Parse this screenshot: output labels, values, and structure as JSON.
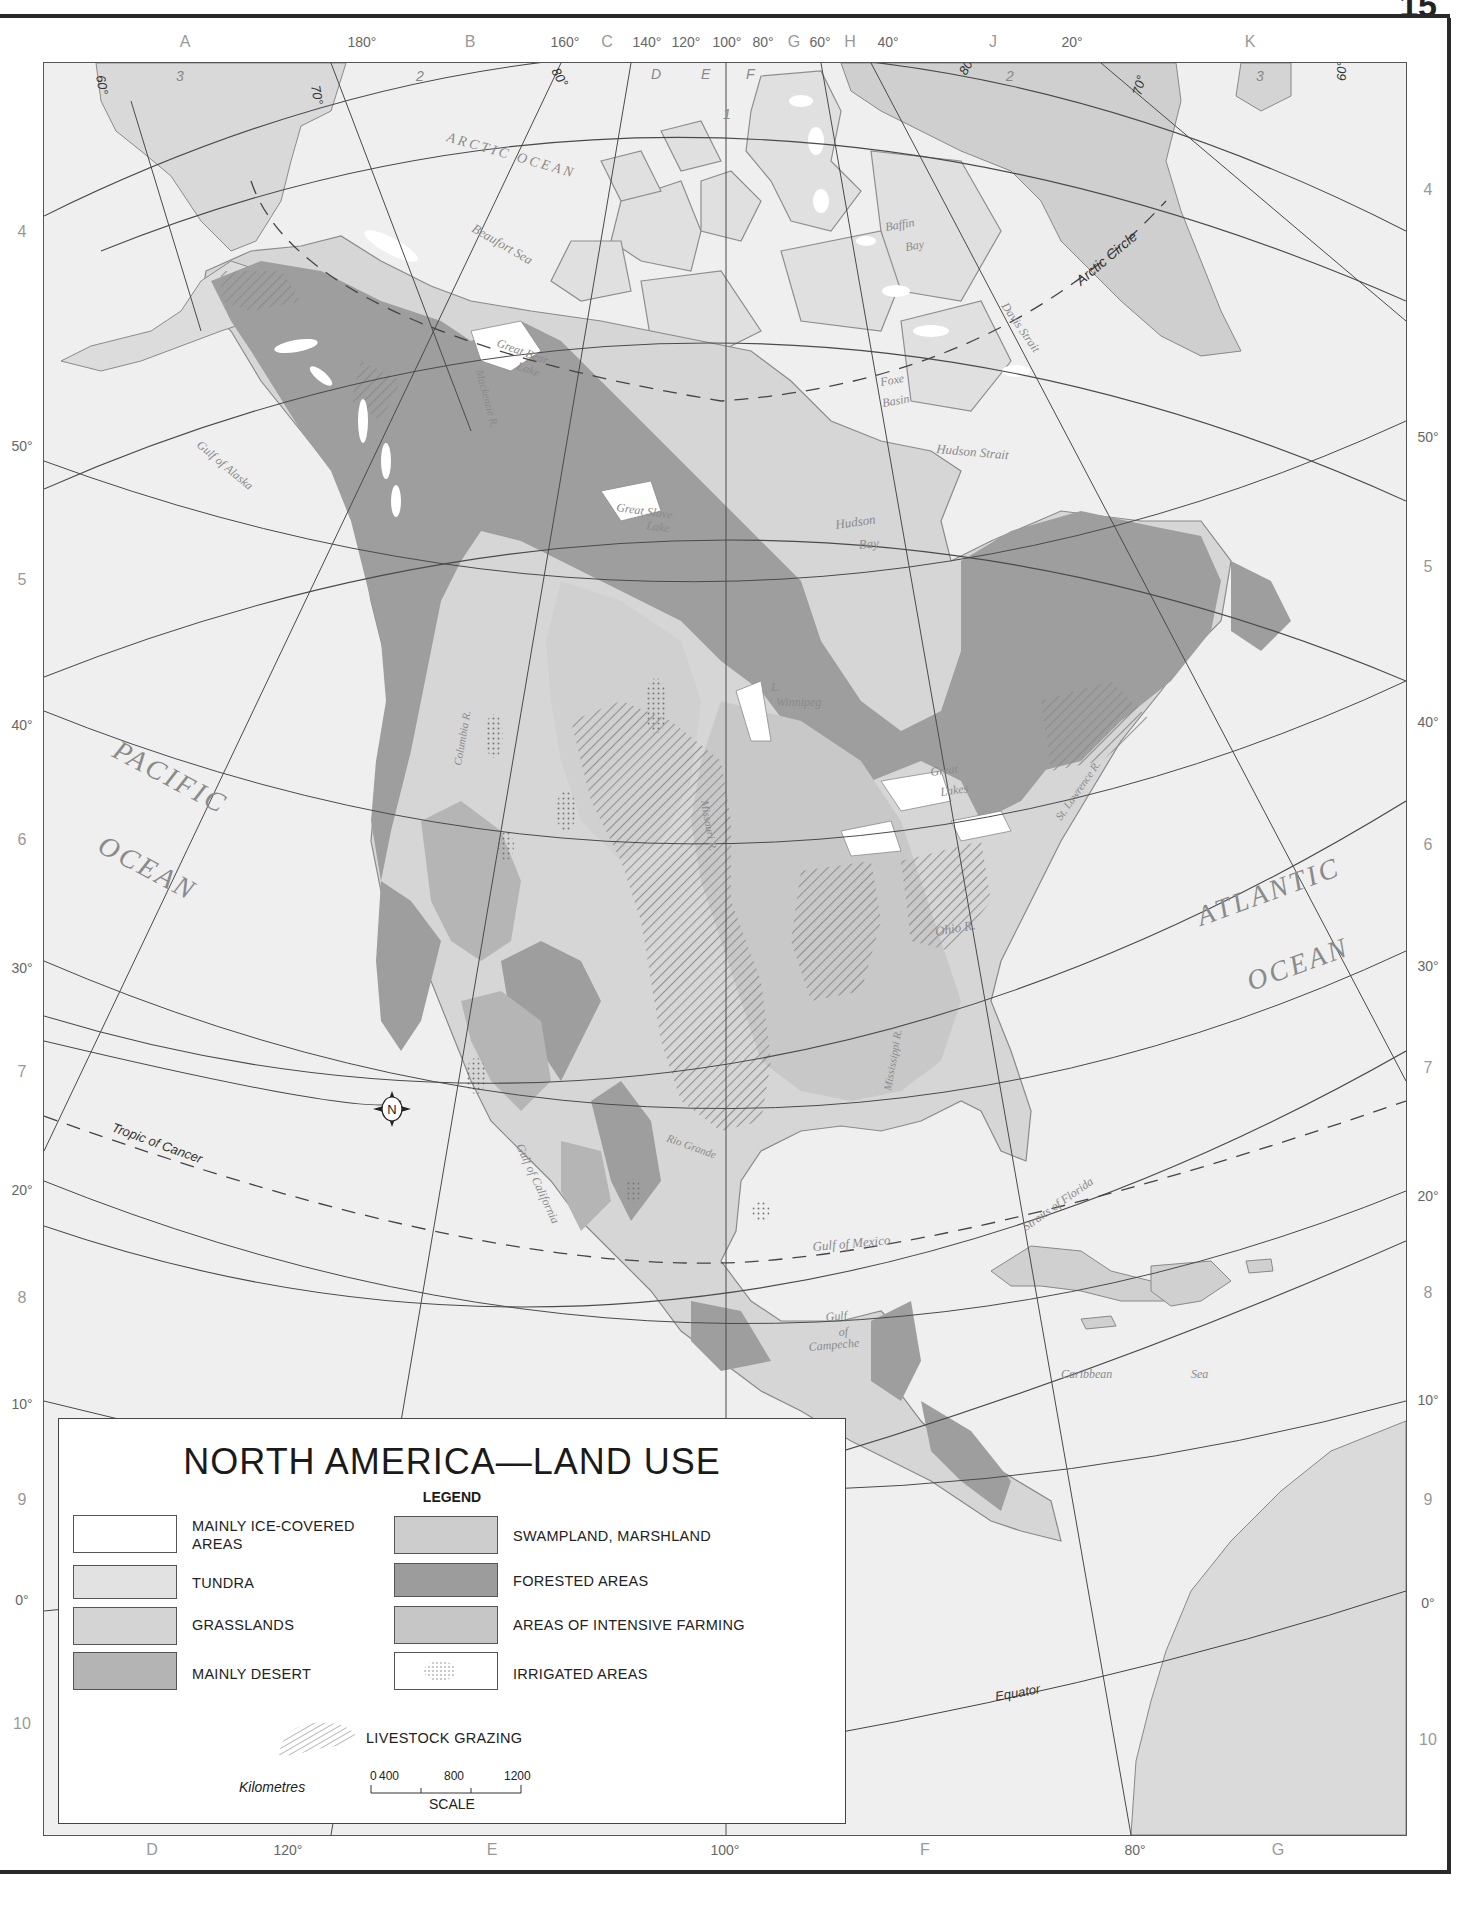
{
  "page": {
    "number": "15"
  },
  "map": {
    "title": "NORTH AMERICA-LAND USE",
    "top_labels": [
      {
        "text": "A",
        "x": 185,
        "type": "grid"
      },
      {
        "text": "180°",
        "x": 362,
        "type": "deg"
      },
      {
        "text": "B",
        "x": 470,
        "type": "grid"
      },
      {
        "text": "160°",
        "x": 565,
        "type": "deg"
      },
      {
        "text": "C",
        "x": 607,
        "type": "grid"
      },
      {
        "text": "140°",
        "x": 647,
        "type": "deg"
      },
      {
        "text": "120°",
        "x": 686,
        "type": "deg"
      },
      {
        "text": "100°",
        "x": 727,
        "type": "deg"
      },
      {
        "text": "80°",
        "x": 763,
        "type": "deg"
      },
      {
        "text": "G",
        "x": 794,
        "type": "grid"
      },
      {
        "text": "60°",
        "x": 820,
        "type": "deg"
      },
      {
        "text": "H",
        "x": 850,
        "type": "grid"
      },
      {
        "text": "40°",
        "x": 888,
        "type": "deg"
      },
      {
        "text": "J",
        "x": 993,
        "type": "grid"
      },
      {
        "text": "20°",
        "x": 1072,
        "type": "deg"
      },
      {
        "text": "K",
        "x": 1250,
        "type": "grid"
      }
    ],
    "bottom_labels": [
      {
        "text": "D",
        "x": 152,
        "type": "grid"
      },
      {
        "text": "120°",
        "x": 288,
        "type": "deg"
      },
      {
        "text": "E",
        "x": 492,
        "type": "grid"
      },
      {
        "text": "100°",
        "x": 725,
        "type": "deg"
      },
      {
        "text": "F",
        "x": 925,
        "type": "grid"
      },
      {
        "text": "80°",
        "x": 1135,
        "type": "deg"
      },
      {
        "text": "G",
        "x": 1278,
        "type": "grid"
      }
    ],
    "left_labels": [
      {
        "text": "4",
        "y": 232,
        "type": "grid"
      },
      {
        "text": "50°",
        "y": 446,
        "type": "deg"
      },
      {
        "text": "5",
        "y": 580,
        "type": "grid"
      },
      {
        "text": "40°",
        "y": 725,
        "type": "deg"
      },
      {
        "text": "6",
        "y": 840,
        "type": "grid"
      },
      {
        "text": "30°",
        "y": 968,
        "type": "deg"
      },
      {
        "text": "7",
        "y": 1072,
        "type": "grid"
      },
      {
        "text": "20°",
        "y": 1190,
        "type": "deg"
      },
      {
        "text": "8",
        "y": 1298,
        "type": "grid"
      },
      {
        "text": "10°",
        "y": 1404,
        "type": "deg"
      },
      {
        "text": "9",
        "y": 1500,
        "type": "grid"
      },
      {
        "text": "0°",
        "y": 1600,
        "type": "deg"
      },
      {
        "text": "10",
        "y": 1724,
        "type": "grid"
      }
    ],
    "right_labels": [
      {
        "text": "4",
        "y": 190,
        "type": "grid"
      },
      {
        "text": "50°",
        "y": 437,
        "type": "deg"
      },
      {
        "text": "5",
        "y": 567,
        "type": "grid"
      },
      {
        "text": "40°",
        "y": 722,
        "type": "deg"
      },
      {
        "text": "6",
        "y": 845,
        "type": "grid"
      },
      {
        "text": "30°",
        "y": 966,
        "type": "deg"
      },
      {
        "text": "7",
        "y": 1068,
        "type": "grid"
      },
      {
        "text": "20°",
        "y": 1196,
        "type": "deg"
      },
      {
        "text": "8",
        "y": 1293,
        "type": "grid"
      },
      {
        "text": "10°",
        "y": 1400,
        "type": "deg"
      },
      {
        "text": "9",
        "y": 1500,
        "type": "grid"
      },
      {
        "text": "0°",
        "y": 1603,
        "type": "deg"
      },
      {
        "text": "10",
        "y": 1740,
        "type": "grid"
      }
    ],
    "inner_labels": {
      "top_row": [
        "3",
        "2",
        "D",
        "E",
        "F",
        "1",
        "2",
        "3"
      ],
      "corner_degrees": [
        "60°",
        "70°",
        "80°",
        "80°",
        "70°",
        "60°"
      ]
    },
    "place_labels": {
      "arctic_ocean": "ARCTIC OCEAN",
      "beaufort_sea": "Beaufort Sea",
      "baffin_bay_1": "Baffin",
      "baffin_bay_2": "Bay",
      "davis_strait": "Davis Strait",
      "arctic_circle": "Arctic Circle",
      "foxe_basin_1": "Foxe",
      "foxe_basin_2": "Basin",
      "hudson_strait": "Hudson Strait",
      "hudson_bay_1": "Hudson",
      "hudson_bay_2": "Bay",
      "great_bear_lake_1": "Great Bear",
      "great_bear_lake_2": "Lake",
      "mackenzie_r": "Mackenzie R.",
      "great_slave_lake_1": "Great Slave",
      "great_slave_lake_2": "Lake",
      "gulf_of_alaska": "Gulf of Alaska",
      "pacific_1": "PACIFIC",
      "pacific_2": "OCEAN",
      "l_winnipeg_1": "L.",
      "l_winnipeg_2": "Winnipeg",
      "great_lakes_1": "Great",
      "great_lakes_2": "Lakes",
      "st_lawrence": "St. Lawrence R.",
      "atlantic_1": "ATLANTIC",
      "atlantic_2": "OCEAN",
      "columbia_r": "Columbia R.",
      "missouri_r": "Missouri R.",
      "ohio_r": "Ohio R.",
      "mississippi_r": "Mississippi R.",
      "rio_grande": "Rio Grande",
      "tropic_of_cancer": "Tropic of Cancer",
      "gulf_of_california": "Gulf of California",
      "gulf_of_mexico": "Gulf of Mexico",
      "straits_of_florida": "Straits of Florida",
      "gulf_of_campeche_1": "Gulf",
      "gulf_of_campeche_2": "of",
      "gulf_of_campeche_3": "Campeche",
      "caribbean_1": "Caribbean",
      "caribbean_2": "Sea",
      "equator": "Equator",
      "compass": "N"
    }
  },
  "legend": {
    "title": "NORTH AMERICA—LAND USE",
    "subtitle": "LEGEND",
    "items": [
      {
        "label_1": "MAINLY ICE-COVERED",
        "label_2": "AREAS",
        "color": "#ffffff",
        "pattern": "none"
      },
      {
        "label_1": "TUNDRA",
        "label_2": "",
        "color": "#e2e2e2",
        "pattern": "none"
      },
      {
        "label_1": "GRASSLANDS",
        "label_2": "",
        "color": "#d4d4d4",
        "pattern": "none"
      },
      {
        "label_1": "MAINLY DESERT",
        "label_2": "",
        "color": "#b4b4b4",
        "pattern": "none"
      },
      {
        "label_1": "SWAMPLAND, MARSHLAND",
        "label_2": "",
        "color": "#cdcdcd",
        "pattern": "none"
      },
      {
        "label_1": "FORESTED AREAS",
        "label_2": "",
        "color": "#9c9c9c",
        "pattern": "none"
      },
      {
        "label_1": "AREAS OF INTENSIVE FARMING",
        "label_2": "",
        "color": "#c6c6c6",
        "pattern": "none"
      },
      {
        "label_1": "IRRIGATED AREAS",
        "label_2": "",
        "color": "#ffffff",
        "pattern": "dots"
      }
    ],
    "grazing": {
      "label": "LIVESTOCK GRAZING",
      "pattern": "hatch"
    },
    "scale": {
      "unit_label": "Kilometres",
      "ticks": [
        "0",
        "400",
        "800",
        "1200"
      ],
      "caption": "SCALE"
    }
  }
}
